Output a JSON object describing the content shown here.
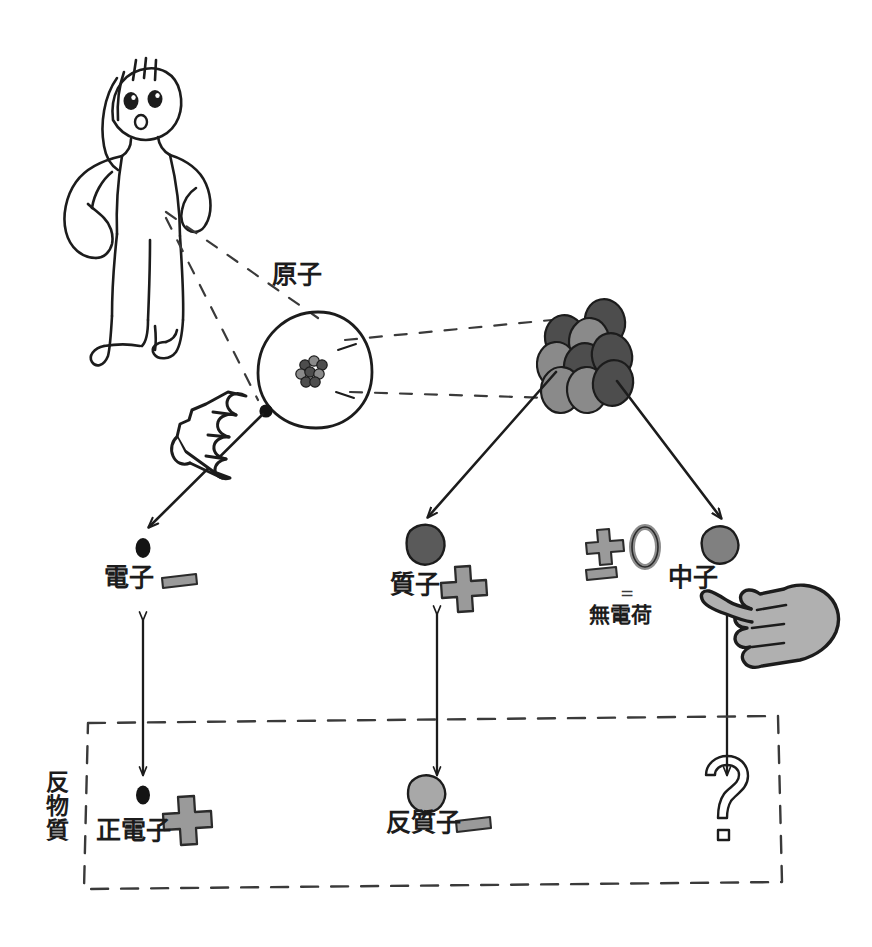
{
  "figure": {
    "background_color": "#ffffff",
    "ink_color": "#1c1c1c"
  },
  "labels": {
    "atom": "原子",
    "electron": "電子",
    "proton": "質子",
    "neutron": "中子",
    "no_charge": "無電荷",
    "equals": "=",
    "antimatter": "反物質",
    "positron": "正電子",
    "antiproton": "反質子",
    "unknown": "?"
  },
  "charge_note": {
    "plus": "+",
    "minus": "-",
    "zero": "0",
    "equals": "=",
    "result": "無電荷"
  },
  "particles": [
    {
      "name": "electron",
      "label": "電子",
      "charge_sign": "minus",
      "color": "#141414",
      "row": "matter"
    },
    {
      "name": "proton",
      "label": "質子",
      "charge_sign": "plus",
      "color": "#5a5a5a",
      "row": "matter"
    },
    {
      "name": "neutron",
      "label": "中子",
      "charge_sign": "none",
      "color": "#808080",
      "row": "matter"
    },
    {
      "name": "positron",
      "label": "正電子",
      "charge_sign": "plus",
      "color": "#141414",
      "row": "antimatter"
    },
    {
      "name": "antiproton",
      "label": "反質子",
      "charge_sign": "minus",
      "color": "#a8a8a8",
      "row": "antimatter"
    },
    {
      "name": "antineutron",
      "label": "?",
      "charge_sign": "none",
      "color": "none",
      "row": "antimatter"
    }
  ],
  "nucleus": {
    "proton_color": "#4d4d4d",
    "neutron_color": "#8a8a8a",
    "count": 9
  },
  "colors": {
    "ink": "#1c1c1c",
    "dark_gray": "#5a5a5a",
    "mid_gray": "#808080",
    "light_gray": "#a8a8a8",
    "sign_gray": "#9a9a9a",
    "hand_gray": "#b0b0b0"
  },
  "icons": {
    "person": "person-figure-icon",
    "pointing_hand_outline": "pointing-hand-outline-icon",
    "pointing_hand_filled": "pointing-hand-filled-icon",
    "question_mark": "question-mark-icon",
    "atom_circle": "atom-circle-icon"
  }
}
